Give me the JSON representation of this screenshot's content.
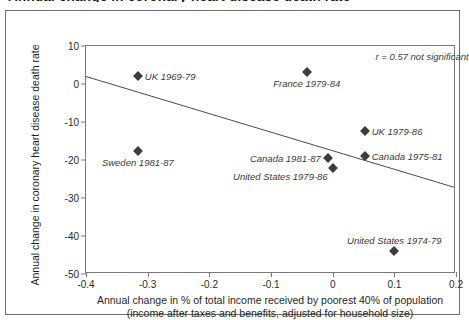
{
  "figure": {
    "clipped_header": "Annual change in coronary heart disease death rate",
    "annotation": "r = 0.57 not significant"
  },
  "chart_data": {
    "type": "scatter",
    "title": "",
    "xlabel_line1": "Annual change in % of total income received by poorest 40% of population",
    "xlabel_line2": "(income after taxes and benefits, adjusted for household size)",
    "ylabel": "Annual change in coronary heart disease death rate",
    "xlim": [
      -0.4,
      0.2
    ],
    "ylim": [
      -50,
      10
    ],
    "xticks": [
      "-0.4",
      "-0.3",
      "-0.2",
      "-0.1",
      "0",
      "0.1",
      "0.2"
    ],
    "xtick_values": [
      -0.4,
      -0.3,
      -0.2,
      -0.1,
      0,
      0.1,
      0.2
    ],
    "yticks": [
      "10",
      "0",
      "-10",
      "-20",
      "-30",
      "-40",
      "-50"
    ],
    "ytick_values": [
      10,
      0,
      -10,
      -20,
      -30,
      -40,
      -50
    ],
    "grid": false,
    "legend": "none",
    "annotations": [
      {
        "text": "r = 0.57 not significant",
        "x": 0.145,
        "y": 7.4
      }
    ],
    "points": [
      {
        "label": "UK 1969-79",
        "x": -0.316,
        "y": 2.2,
        "label_pos": "right"
      },
      {
        "label": "France 1979-84",
        "x": -0.042,
        "y": 3.2,
        "label_pos": "below"
      },
      {
        "label": "Sweden 1981-87",
        "x": -0.316,
        "y": -17.6,
        "label_pos": "below"
      },
      {
        "label": "Canada 1981-87",
        "x": -0.008,
        "y": -19.6,
        "label_pos": "left"
      },
      {
        "label": "United States 1979-86",
        "x": 0.0,
        "y": -22.0,
        "label_pos": "below-left"
      },
      {
        "label": "UK 1979-86",
        "x": 0.052,
        "y": -12.4,
        "label_pos": "right"
      },
      {
        "label": "Canada 1975-81",
        "x": 0.052,
        "y": -19.0,
        "label_pos": "right"
      },
      {
        "label": "United States 1974-79",
        "x": 0.1,
        "y": -44.0,
        "label_pos": "above"
      }
    ],
    "trendline": {
      "x0": -0.4,
      "y0": 1.9,
      "x1": 0.2,
      "y1": -27.5
    },
    "marker_color": "#3d3d3d",
    "axis_color": "#7a7a7a"
  }
}
